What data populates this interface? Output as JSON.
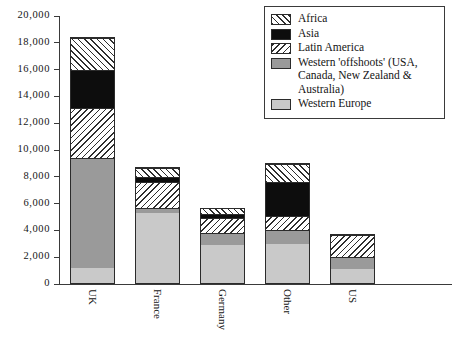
{
  "chart_data": {
    "type": "bar",
    "subtype": "stacked-bar",
    "title": "",
    "xlabel": "",
    "ylabel": "",
    "ylim": [
      0,
      20000
    ],
    "ytick_labels": [
      "20,000",
      "18,000",
      "16,000",
      "14,000",
      "12,000",
      "10,000",
      "8,000",
      "6,000",
      "4,000",
      "2,000",
      "0"
    ],
    "ytick_values": [
      20000,
      18000,
      16000,
      14000,
      12000,
      10000,
      8000,
      6000,
      4000,
      2000,
      0
    ],
    "grid": false,
    "legend_position": "top-right",
    "categories": [
      "UK",
      "France",
      "Germany",
      "Other",
      "US"
    ],
    "series": [
      {
        "name": "Western Europe",
        "pattern": "solid-light-gray",
        "color": "#c9c9c9",
        "values": [
          1200,
          5300,
          2900,
          3000,
          1100
        ]
      },
      {
        "name": "Western 'offshoots' (USA, Canada, New Zealand & Australia)",
        "pattern": "solid-gray",
        "color": "#9a9a9a",
        "values": [
          8200,
          400,
          900,
          1000,
          900
        ]
      },
      {
        "name": "Latin America",
        "pattern": "backward-diagonal-hatch",
        "color": "#ffffff",
        "values": [
          3700,
          1900,
          1100,
          1100,
          1700
        ]
      },
      {
        "name": "Asia",
        "pattern": "solid-black",
        "color": "#0d0d0d",
        "values": [
          2900,
          400,
          300,
          2500,
          0
        ]
      },
      {
        "name": "Africa",
        "pattern": "forward-diagonal-hatch",
        "color": "#ffffff",
        "values": [
          2400,
          700,
          500,
          1400,
          0
        ]
      }
    ],
    "totals": [
      18400,
      8700,
      5700,
      8000,
      3700
    ]
  },
  "legend": {
    "items": [
      {
        "label": "Africa",
        "swatch": "forward-diagonal-hatch"
      },
      {
        "label": "Asia",
        "swatch": "solid-black"
      },
      {
        "label": "Latin America",
        "swatch": "backward-diagonal-hatch"
      },
      {
        "label": "Western 'offshoots' (USA, Canada, New Zealand & Australia)",
        "swatch": "solid-gray"
      },
      {
        "label": "Western Europe",
        "swatch": "solid-light-gray"
      }
    ]
  },
  "axis": {
    "y_ticks": [
      "20,000",
      "18,000",
      "16,000",
      "14,000",
      "12,000",
      "10,000",
      "8,000",
      "6,000",
      "4,000",
      "2,000",
      "0"
    ],
    "x_ticks": [
      "UK",
      "France",
      "Germany",
      "Other",
      "US"
    ]
  },
  "colors": {
    "axis": "#3a3a3a",
    "outline": "#2b2b2b",
    "western_europe": "#c9c9c9",
    "offshoots": "#9a9a9a",
    "asia": "#0d0d0d",
    "hatch": "#2e2e2e",
    "background": "#ffffff"
  }
}
